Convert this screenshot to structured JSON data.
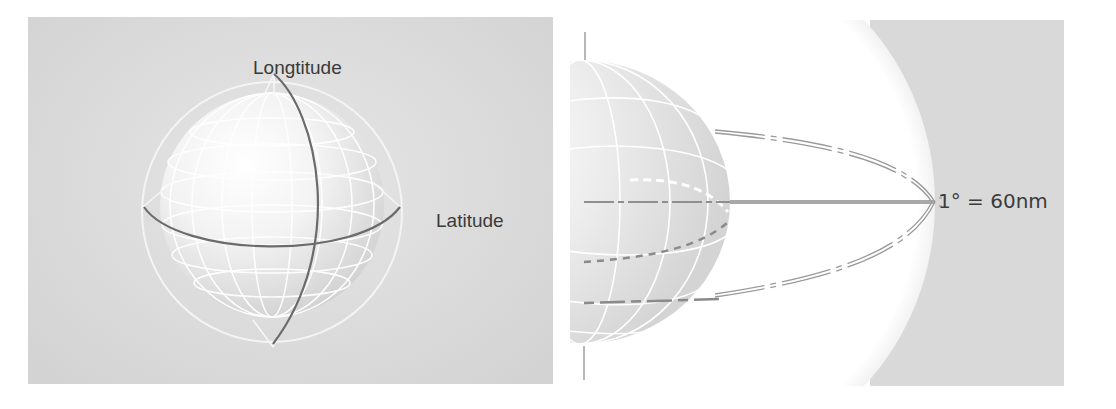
{
  "figure": {
    "left_panel": {
      "title": "Longitude and latitude on a globe",
      "labels": {
        "longitude": "Longtitude",
        "latitude": "Latitude"
      },
      "colors": {
        "background": "#d8d8d8",
        "great_circles": "#6e6e6e",
        "wireframe": "#ffffff"
      }
    },
    "right_panel": {
      "title": "One degree of arc equals sixty nautical miles",
      "labels": {
        "scale": "1° = 60nm"
      },
      "colors": {
        "background": "#d9d9d9",
        "highlight": "#ffffff",
        "arc_lines": "#8c8c8c"
      }
    }
  }
}
